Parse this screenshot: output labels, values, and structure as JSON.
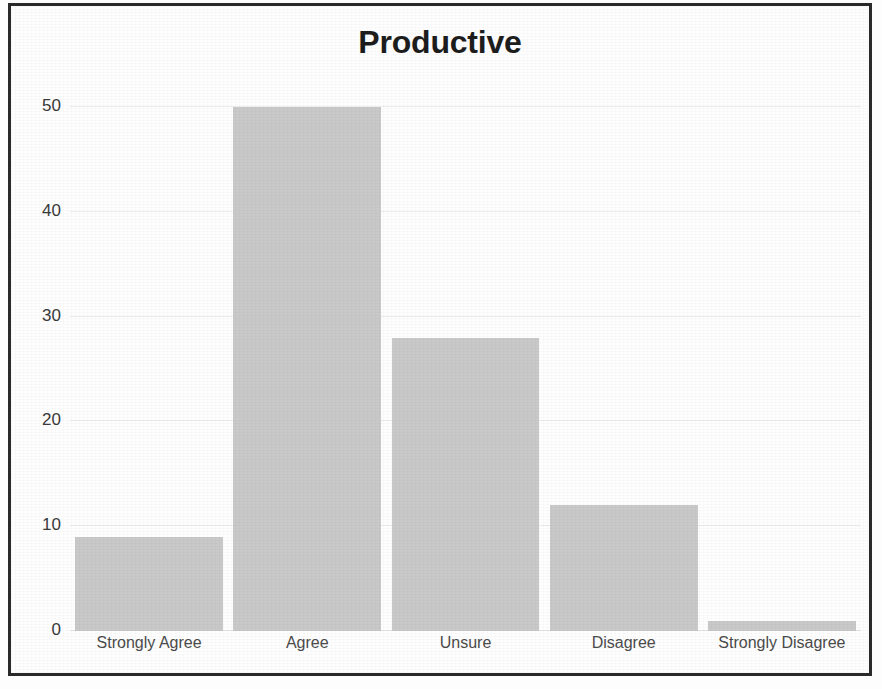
{
  "chart_data": {
    "type": "bar",
    "title": "Productive",
    "xlabel": "",
    "ylabel": "",
    "categories": [
      "Strongly Agree",
      "Agree",
      "Unsure",
      "Disagree",
      "Strongly Disagree"
    ],
    "values": [
      9,
      50,
      28,
      12,
      1
    ],
    "ylim": [
      0,
      50
    ],
    "yticks": [
      0,
      10,
      20,
      30,
      40,
      50
    ],
    "ytick_labels": [
      "0",
      "10",
      "20",
      "30",
      "40",
      "50"
    ],
    "grid": true,
    "legend": false,
    "legend_position": "none",
    "colors": {
      "bar_fill": "#c9c9c9",
      "gridline": "#ededed",
      "title_text": "#1d1d1d",
      "tick_text": "#3a3a3a",
      "category_text": "#4b4b4b",
      "frame_border": "#2a2a2a",
      "background": "#ffffff"
    }
  }
}
